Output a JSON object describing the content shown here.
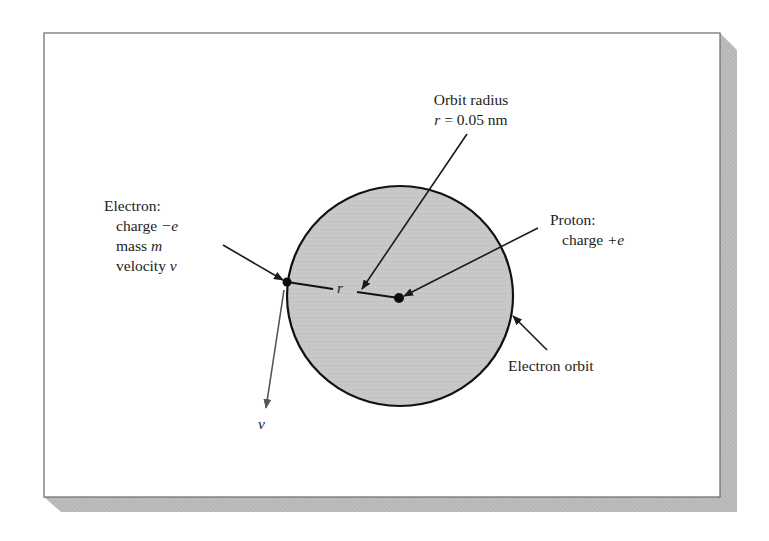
{
  "figure": {
    "type": "bohr-hydrogen-atom-diagram",
    "frame": {
      "background": "#ffffff",
      "border_color": "#6a6a6a",
      "shadow_color": "#b5b5b5"
    },
    "orbit": {
      "fill": "#c6c6c6",
      "stroke": "#111111",
      "center": [
        400,
        296
      ],
      "rx": 113,
      "ry": 110
    },
    "labels": {
      "orbit_radius": {
        "line1": "Orbit radius",
        "line2_var": "r",
        "line2_rest": " = 0.05 nm"
      },
      "electron": {
        "title": "Electron:",
        "charge_text": "charge ",
        "charge_var": "−e",
        "mass_text": "mass ",
        "mass_var": "m",
        "velocity_text": "velocity ",
        "velocity_var": "v"
      },
      "proton": {
        "title": "Proton:",
        "charge_text": "charge ",
        "charge_var": "+e"
      },
      "electron_orbit": "Electron orbit",
      "radius_symbol": "r",
      "velocity_symbol": "v"
    },
    "points": {
      "electron": [
        287,
        282
      ],
      "proton": [
        399,
        298
      ]
    }
  }
}
